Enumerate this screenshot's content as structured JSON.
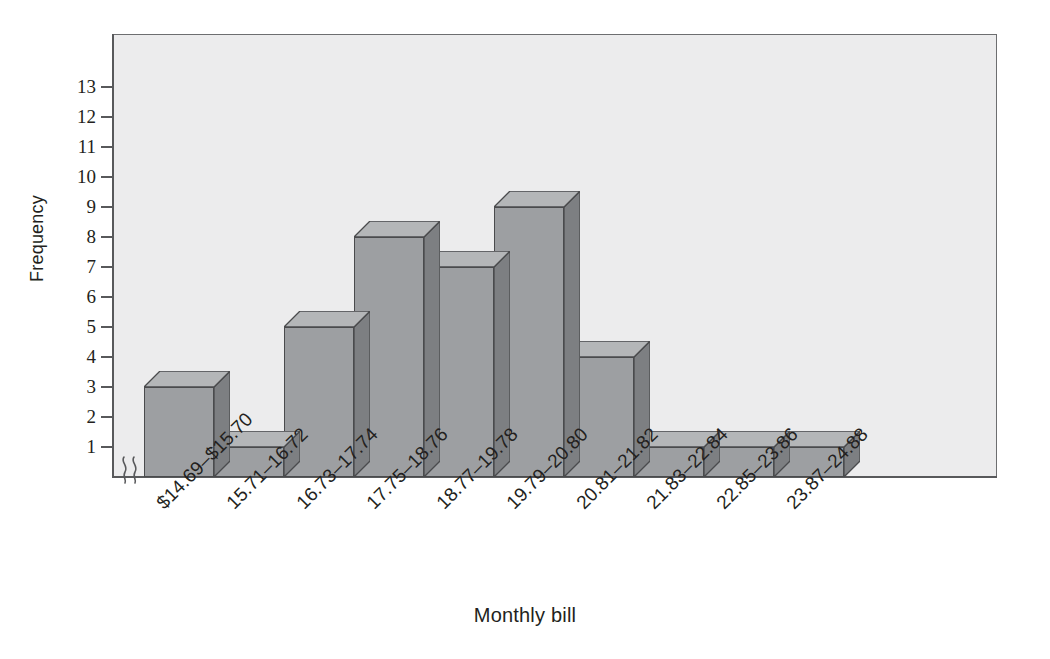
{
  "chart_data": {
    "type": "bar",
    "title": "",
    "xlabel": "Monthly bill",
    "ylabel": "Frequency",
    "categories": [
      "$14.69–$15.70",
      "15.71–16.72",
      "16.73–17.74",
      "17.75–18.76",
      "18.77–19.78",
      "19.79–20.80",
      "20.81–21.82",
      "21.83–22.84",
      "22.85–23.86",
      "23.87–24.88"
    ],
    "values": [
      3,
      1,
      5,
      8,
      7,
      9,
      4,
      1,
      1,
      1
    ],
    "ylim": [
      0,
      13.8
    ],
    "yticks": [
      1,
      2,
      3,
      4,
      5,
      6,
      7,
      8,
      9,
      10,
      11,
      12,
      13
    ],
    "ytick_labels": [
      "1",
      "2",
      "3",
      "4",
      "5",
      "6",
      "7",
      "8",
      "9",
      "10",
      "11",
      "12",
      "13"
    ],
    "grid": false,
    "legend": null,
    "axis_break": "y-axis break between 0 and 1",
    "style": "3d-histogram",
    "colors": {
      "bar_front": "#9d9fa2",
      "bar_top": "#b4b6b8",
      "bar_side": "#7d7f82",
      "bar_outline": "#4a4b4d",
      "plot_background": "#ececed",
      "axis": "#58595b",
      "text": "#231f20"
    }
  }
}
